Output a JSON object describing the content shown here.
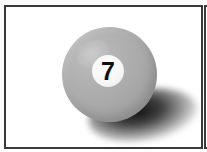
{
  "image": {
    "subject": "billiard-ball",
    "ball": {
      "number": "7",
      "color": "#a9a9a9",
      "number_disc_color": "#f6f6f6",
      "number_color": "#111111"
    },
    "frame_border_color": "#3a3a3a",
    "background_color": "#ffffff"
  }
}
